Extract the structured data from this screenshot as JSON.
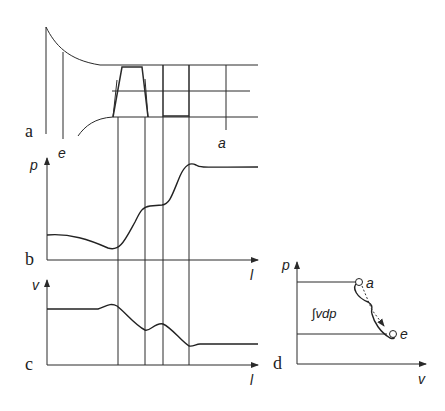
{
  "panels": {
    "a": {
      "label": "a",
      "point_e": "e",
      "point_a": "a"
    },
    "b": {
      "label": "b",
      "y_axis": "p",
      "x_axis": "l"
    },
    "c": {
      "label": "c",
      "y_axis": "v",
      "x_axis": "l"
    },
    "d": {
      "label": "d",
      "y_axis": "p",
      "x_axis": "v",
      "point_a": "a",
      "point_e": "e",
      "integral": "∫vdp"
    }
  },
  "colors": {
    "line": "#2a2a2a",
    "background": "#ffffff"
  }
}
